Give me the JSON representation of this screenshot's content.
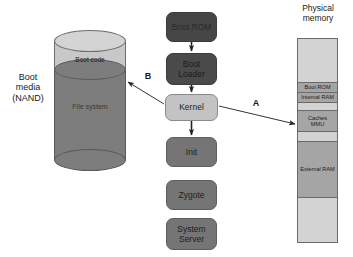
{
  "diagram": {
    "title_physical_memory": "Physical\nmemory",
    "boot_media_label": "Boot\nmedia\n(NAND)",
    "cylinder": {
      "top_band_label": "Boot code",
      "body_label": "File system"
    },
    "flow_boxes": [
      {
        "name": "boot-rom",
        "label": "Boot ROM",
        "style": "dark-rom",
        "x": 166,
        "y": 12,
        "w": 51,
        "h": 30
      },
      {
        "name": "boot-loader",
        "label": "Boot\nLoader",
        "style": "dark-loader",
        "x": 166,
        "y": 53,
        "w": 51,
        "h": 32
      },
      {
        "name": "kernel",
        "label": "Kernel",
        "style": "light",
        "x": 165,
        "y": 94,
        "w": 53,
        "h": 27
      },
      {
        "name": "init",
        "label": "Init",
        "style": "mid",
        "x": 166,
        "y": 137,
        "w": 51,
        "h": 30
      },
      {
        "name": "zygote",
        "label": "Zygote",
        "style": "mid",
        "x": 166,
        "y": 180,
        "w": 51,
        "h": 30
      },
      {
        "name": "system-server",
        "label": "System\nServer",
        "style": "mid",
        "x": 166,
        "y": 218,
        "w": 51,
        "h": 32
      }
    ],
    "memory_segments": [
      {
        "name": "memory-segment-empty-top",
        "label": "",
        "fill": "empty",
        "top": 0,
        "height": 43,
        "divider": false
      },
      {
        "name": "memory-segment-boot-rom",
        "label": "Boot ROM",
        "fill": "filled",
        "top": 43,
        "height": 10,
        "divider": true
      },
      {
        "name": "memory-segment-internal-ram",
        "label": "Internal RAM",
        "fill": "filled",
        "top": 53,
        "height": 10,
        "divider": true
      },
      {
        "name": "memory-segment-gap-1",
        "label": "",
        "fill": "empty",
        "top": 63,
        "height": 8,
        "divider": true
      },
      {
        "name": "memory-segment-caches-mmu",
        "label": "Caches\nMMU",
        "fill": "filled",
        "top": 71,
        "height": 21,
        "divider": true
      },
      {
        "name": "memory-segment-gap-2",
        "label": "",
        "fill": "empty",
        "top": 92,
        "height": 10,
        "divider": true
      },
      {
        "name": "memory-segment-external-ram",
        "label": "External RAM",
        "fill": "filled",
        "top": 102,
        "height": 56,
        "divider": true
      },
      {
        "name": "memory-segment-empty-bottom",
        "label": "",
        "fill": "empty",
        "top": 158,
        "height": 45,
        "divider": true
      }
    ],
    "arrow_labels": {
      "a": "A",
      "b": "B"
    },
    "colors": {
      "box_dark": "#464646",
      "box_mid": "#757575",
      "box_light": "#c3c3c3",
      "memory_filled": "#a5a5a5",
      "memory_empty": "#d3d3d3",
      "cylinder_body": "#7d7d7d",
      "cylinder_top": "#d4d4d4",
      "text": "#1a1a1a"
    }
  }
}
